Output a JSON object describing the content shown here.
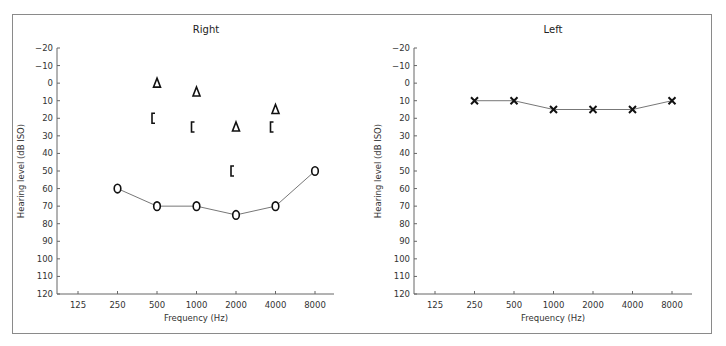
{
  "chart_data": [
    {
      "type": "scatter",
      "title": "Right",
      "xlabel": "Frequency (Hz)",
      "ylabel": "Hearing level (dB ISO)",
      "x_categories": [
        "125",
        "250",
        "500",
        "1000",
        "2000",
        "4000",
        "8000"
      ],
      "y_ticks": [
        -20,
        -10,
        0,
        10,
        20,
        30,
        40,
        50,
        60,
        70,
        80,
        90,
        100,
        110,
        120
      ],
      "ylim": [
        -20,
        120
      ],
      "y_inverted": true,
      "grid": false,
      "series": [
        {
          "name": "Air conduction (O)",
          "symbol": "O",
          "connected": true,
          "x": [
            "250",
            "500",
            "1000",
            "2000",
            "4000",
            "8000"
          ],
          "values": [
            60,
            70,
            70,
            75,
            70,
            50
          ]
        },
        {
          "name": "Masked air conduction (Δ)",
          "symbol": "Δ",
          "connected": false,
          "x": [
            "500",
            "1000",
            "2000",
            "4000"
          ],
          "values": [
            0,
            5,
            25,
            15
          ]
        },
        {
          "name": "Masked bone conduction ([)",
          "symbol": "[",
          "connected": false,
          "x": [
            "500",
            "1000",
            "2000",
            "4000"
          ],
          "values": [
            20,
            25,
            50,
            25
          ]
        }
      ]
    },
    {
      "type": "line",
      "title": "Left",
      "xlabel": "Frequency (Hz)",
      "ylabel": "Hearing level (dB ISO)",
      "x_categories": [
        "125",
        "250",
        "500",
        "1000",
        "2000",
        "4000",
        "8000"
      ],
      "y_ticks": [
        -20,
        -10,
        0,
        10,
        20,
        30,
        40,
        50,
        60,
        70,
        80,
        90,
        100,
        110,
        120
      ],
      "ylim": [
        -20,
        120
      ],
      "y_inverted": true,
      "grid": false,
      "series": [
        {
          "name": "Air conduction (X)",
          "symbol": "×",
          "connected": true,
          "x": [
            "250",
            "500",
            "1000",
            "2000",
            "4000",
            "8000"
          ],
          "values": [
            10,
            10,
            15,
            15,
            15,
            10
          ]
        }
      ]
    }
  ],
  "labels": {
    "right_title": "Right",
    "left_title": "Left",
    "xlabel": "Frequency (Hz)",
    "ylabel": "Hearing level (dB ISO)"
  }
}
